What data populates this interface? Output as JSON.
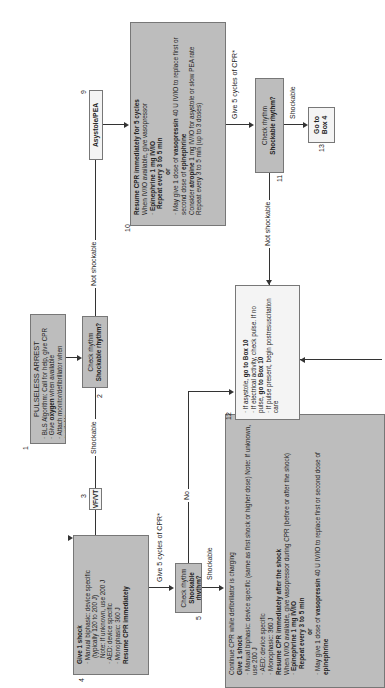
{
  "boxes": {
    "b1": {
      "num": "1",
      "title": "PULSELESS ARREST",
      "items": [
        "BLS Algorithm: Call for help, give CPR",
        "Give oxygen when available",
        "Attach monitor/defibrillator when available"
      ]
    },
    "b2": {
      "num": "2",
      "line1": "Check rhythm",
      "line2": "Shockable rhythm?"
    },
    "b3": {
      "num": "3",
      "label": "VF/VT"
    },
    "b4": {
      "num": "4",
      "title": "Give 1 shock",
      "item1": "Manual biphasic: device specific",
      "item1b": "(typically 120 to 200 J)",
      "item1c": "Note: If unknown, use 200 J",
      "item2": "AED: device specific",
      "item3": "Monophasic: 360 J",
      "footer": "Resume CPR immediately"
    },
    "b5": {
      "num": "5",
      "line1": "Check rhythm",
      "line2": "Shockable rhythm?"
    },
    "b6": {
      "num": "6",
      "l1": "Continue CPR while defibrillator is charging",
      "l2": "Give 1 shock",
      "l3": "Manual biphasic: device specific (same as first shock or higher dose) Note: If unknown, use 200 J",
      "l4": "AED: device specific",
      "l5": "Monophasic: 360 J",
      "l6": "Resume CPR immediately after the shock",
      "l7": "When IV/IO available, give vasopressor during CPR (before or after the shock)",
      "l8": "Epinephrine 1 mg IV/IO",
      "l9": "Repeat every 3 to 5 min",
      "l10": "or",
      "l11a": "May give 1 dose of ",
      "l11b": "vasopressin",
      "l11c": " 40 U IV/IO to replace first or second dose of ",
      "l11d": "epinephrine"
    },
    "b9": {
      "num": "9",
      "label": "Asystole/PEA"
    },
    "b10": {
      "num": "10",
      "l1": "Resume CPR immediately for 5 cycles",
      "l2": "When IV/IO available, give vasopressor",
      "l3": "Epinephrine 1 mg IV/IO",
      "l4": "Repeat every 3 to 5 min",
      "l5": "or",
      "l6a": "May give 1 dose of ",
      "l6b": "vasopressin",
      "l6c": " 40 U IV/IO to replace first or second dose of ",
      "l6d": "epinephrine",
      "l7a": "Consider ",
      "l7b": "atropine",
      "l7c": " 1 mg IV/IO for asystole or slow PEA rate",
      "l8": "Repeat every 3 to 5 min (up to 3 doses)"
    },
    "b11": {
      "num": "11",
      "line1": "Check rhythm",
      "line2": "Shockable rhythm?"
    },
    "b12": {
      "num": "12",
      "i1a": "If asystole, ",
      "i1b": "go to Box 10",
      "i2a": "If electrical activity, check pulse. If no pulse, ",
      "i2b": "go to Box 10",
      "i3": "If pulse present, begin postresuscitation care"
    },
    "b13": {
      "num": "13",
      "line1": "Go to",
      "line2": "Box 4"
    }
  },
  "labels": {
    "shockable_1": "Shockable",
    "not_shockable_1": "Not shockable",
    "give5_1": "Give 5 cycles of CPR*",
    "give5_2": "Give 5 cycles of CPR*",
    "shockable_2": "Shockable",
    "no": "No",
    "shockable_3": "Shockable",
    "not_shockable_2": "Not shockable"
  }
}
